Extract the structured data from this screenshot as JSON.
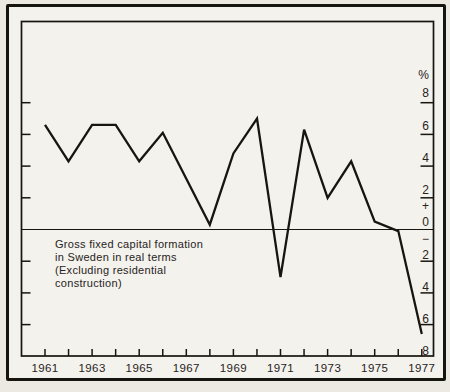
{
  "figure": {
    "caption": "Gross fixed capital formation\nin Sweden in real terms\n(Excluding residential\nconstruction)",
    "unit_label": "%"
  },
  "colors": {
    "paper": "#ece9e2",
    "plot_background": "#f4f2ec",
    "ink": "#17150f",
    "text": "#26231d"
  },
  "chart_data": {
    "type": "line",
    "title": "Gross fixed capital formation in Sweden in real terms (Excluding residential construction)",
    "x": [
      1961,
      1962,
      1963,
      1964,
      1965,
      1966,
      1967,
      1968,
      1969,
      1970,
      1971,
      1972,
      1973,
      1974,
      1975,
      1976,
      1977
    ],
    "values": [
      6.6,
      4.3,
      6.6,
      6.6,
      4.3,
      6.1,
      3.2,
      0.3,
      4.8,
      7.0,
      -3.0,
      6.3,
      2.0,
      4.3,
      0.5,
      -0.1,
      -6.6
    ],
    "ylabel": "%",
    "ylim": [
      -8,
      8
    ],
    "y_tick_interval": 2,
    "y_side_tick_values": [
      8,
      6,
      4,
      2,
      -2,
      -4,
      -6
    ],
    "x_tick_labels": [
      "1961",
      "1963",
      "1965",
      "1967",
      "1969",
      "1971",
      "1973",
      "1975",
      "1977"
    ],
    "right_axis_labels": [
      "%",
      "8",
      "6",
      "4",
      "2",
      "+",
      "0",
      "−",
      "2",
      "4",
      "6",
      "8"
    ],
    "grid": false,
    "legend": "none",
    "zero_line": true,
    "line_color": "#17150f",
    "background": "#f4f2ec"
  }
}
